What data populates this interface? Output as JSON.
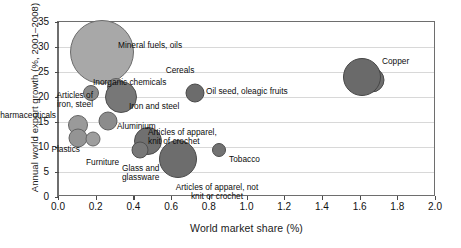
{
  "chart_data": {
    "type": "scatter",
    "title": "",
    "xlabel": "World market share (%)",
    "ylabel": "Annual world export growth (%, 2001–2008)",
    "xlim": [
      0.0,
      2.0
    ],
    "ylim": [
      0,
      35
    ],
    "xticks": [
      "0.0",
      "0.2",
      "0.4",
      "0.6",
      "0.8",
      "1.0",
      "1.2",
      "1.4",
      "1.6",
      "1.8",
      "2.0"
    ],
    "xtick_values": [
      0.0,
      0.2,
      0.4,
      0.6,
      0.8,
      1.0,
      1.2,
      1.4,
      1.6,
      1.8,
      2.0
    ],
    "yticks": [
      "0",
      "5",
      "10",
      "15",
      "20",
      "25",
      "30",
      "35"
    ],
    "ytick_values": [
      0,
      5,
      10,
      15,
      20,
      25,
      30,
      35
    ],
    "grid": "horizontal",
    "legend": "none",
    "size_encoding": "bubble area ~ export value",
    "points": [
      {
        "label": "Mineral fuels, oils",
        "x": 0.23,
        "y": 29.0,
        "r": 32.0,
        "color": "#a8a8a8",
        "stroke": "#6b6b6b",
        "label_x": 118,
        "label_y": 41,
        "align": "left"
      },
      {
        "label": "Inorganic chemicals",
        "x": 0.3,
        "y": 22.0,
        "r": 9.0,
        "color": "#8f8f8f",
        "stroke": "#5f5f5f",
        "label_x": 93,
        "label_y": 78,
        "align": "left"
      },
      {
        "label": "Articles of\niron, steel",
        "x": 0.17,
        "y": 20.8,
        "r": 8.0,
        "color": "#8a8a8a",
        "stroke": "#5c5c5c",
        "label_x": 93,
        "label_y": 91,
        "align": "right"
      },
      {
        "label": "Iron and steel",
        "x": 0.33,
        "y": 20.0,
        "r": 16.0,
        "color": "#777777",
        "stroke": "#4f4f4f",
        "label_x": 129,
        "label_y": 102,
        "align": "left"
      },
      {
        "label": "Cereals",
        "x": 1.66,
        "y": 23.4,
        "r": 12.5,
        "color": "#6f6f6f",
        "stroke": "#4a4a4a",
        "label_x": 180,
        "label_y": 66,
        "align": "center"
      },
      {
        "label": "Oil seed, oleagic fruits",
        "x": 0.72,
        "y": 20.8,
        "r": 9.5,
        "color": "#6c6c6c",
        "stroke": "#484848",
        "label_x": 206,
        "label_y": 87,
        "align": "left"
      },
      {
        "label": "Copper",
        "x": 1.61,
        "y": 24.0,
        "r": 19.0,
        "color": "#6a6a6a",
        "stroke": "#464646",
        "label_x": 382,
        "label_y": 57,
        "align": "left"
      },
      {
        "label": "Pharmaceuticals",
        "x": 0.1,
        "y": 14.4,
        "r": 10.0,
        "color": "#9a9a9a",
        "stroke": "#656565",
        "label_x": 56,
        "label_y": 111,
        "align": "right"
      },
      {
        "label": "Aluminium",
        "x": 0.26,
        "y": 15.3,
        "r": 9.5,
        "color": "#8c8c8c",
        "stroke": "#5d5d5d",
        "label_x": 117,
        "label_y": 122,
        "align": "left"
      },
      {
        "label": "Plastics",
        "x": 0.1,
        "y": 11.8,
        "r": 9.5,
        "color": "#949494",
        "stroke": "#626262",
        "label_x": 80,
        "label_y": 145,
        "align": "right"
      },
      {
        "label": "Furniture",
        "x": 0.18,
        "y": 11.6,
        "r": 7.5,
        "color": "#9e9e9e",
        "stroke": "#676767",
        "label_x": 86,
        "label_y": 158,
        "align": "left"
      },
      {
        "label": "Articles of apparel,\nknit of crochet",
        "x": 0.47,
        "y": 11.2,
        "r": 14.0,
        "color": "#707070",
        "stroke": "#4b4b4b",
        "label_x": 148,
        "label_y": 128,
        "align": "left"
      },
      {
        "label": "Glass and\nglassware",
        "x": 0.43,
        "y": 9.5,
        "r": 8.5,
        "color": "#787878",
        "stroke": "#4f4f4f",
        "label_x": 122,
        "label_y": 164,
        "align": "left"
      },
      {
        "label": "Articles of apparel, not\nknit or crochet",
        "x": 0.63,
        "y": 7.7,
        "r": 19.0,
        "color": "#6d6d6d",
        "stroke": "#494949",
        "label_x": 217,
        "label_y": 183,
        "align": "center"
      },
      {
        "label": "Tobacco",
        "x": 0.85,
        "y": 9.5,
        "r": 7.0,
        "color": "#727272",
        "stroke": "#4d4d4d",
        "label_x": 229,
        "label_y": 155,
        "align": "left"
      }
    ]
  }
}
